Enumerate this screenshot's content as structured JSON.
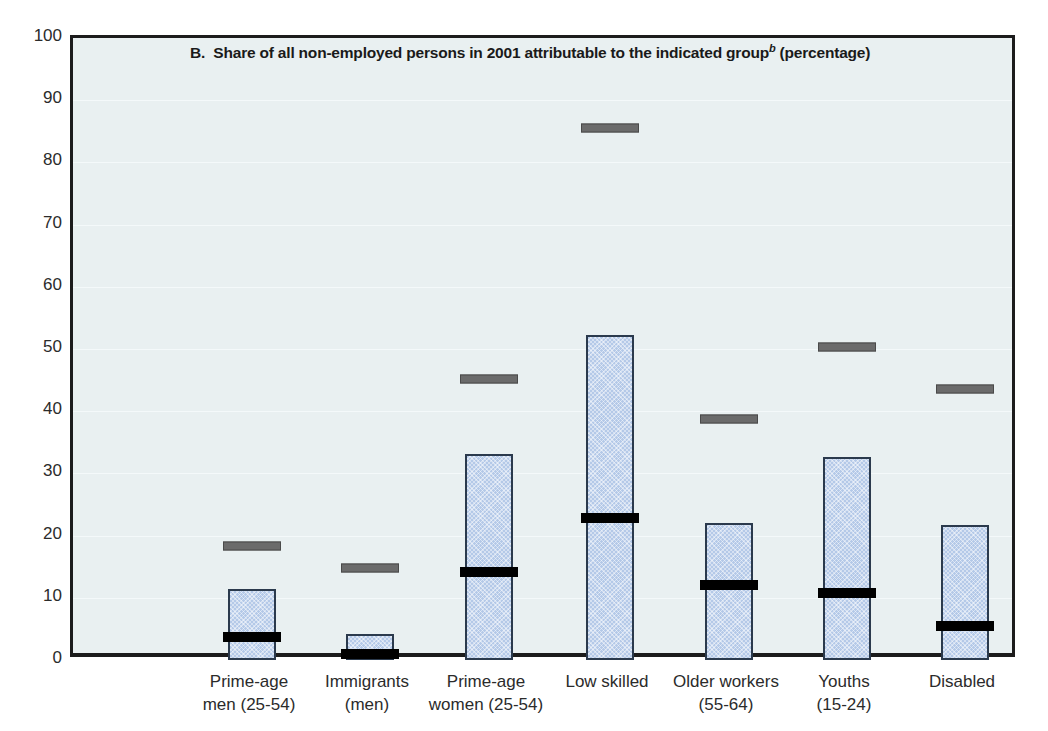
{
  "chart_data": {
    "type": "bar",
    "title_prefix": "B.",
    "title_main": "Share of all non-employed persons in 2001 attributable to the indicated group",
    "title_superscript": "b",
    "title_suffix": "(percentage)",
    "xlabel": "",
    "ylabel": "",
    "ylim": [
      0,
      100
    ],
    "ytick_values": [
      100,
      90,
      80,
      70,
      60,
      50,
      40,
      30,
      20,
      10,
      0
    ],
    "ytick_labels": [
      "100",
      "90",
      "80",
      "70",
      "60",
      "50",
      "40",
      "30",
      "20",
      "10",
      "0"
    ],
    "grid": true,
    "legend": "none",
    "categories": [
      "Prime-age men (25-54)",
      "Immigrants (men)",
      "Prime-age women (25-54)",
      "Low skilled",
      "Older workers (55-64)",
      "Youths (15-24)",
      "Disabled"
    ],
    "category_label_lines": [
      [
        "Prime-age",
        "men (25-54)"
      ],
      [
        "Immigrants",
        "(men)"
      ],
      [
        "Prime-age",
        "women (25-54)"
      ],
      [
        "Low skilled",
        ""
      ],
      [
        "Older workers",
        "(55-64)"
      ],
      [
        "Youths",
        "(15-24)"
      ],
      [
        "Disabled",
        ""
      ]
    ],
    "series": [
      {
        "name": "bar-value",
        "style": "bar",
        "color": "#b4c9e8",
        "values": [
          11.4,
          4.2,
          33.1,
          52.2,
          22.1,
          32.6,
          21.7
        ]
      },
      {
        "name": "black-marker",
        "style": "marker",
        "color": "#000000",
        "values": [
          3.7,
          0.9,
          14.1,
          22.8,
          12.0,
          10.7,
          5.4
        ]
      },
      {
        "name": "grey-marker",
        "style": "marker",
        "color": "#6b6b6b",
        "values": [
          18.3,
          14.8,
          45.2,
          85.5,
          38.7,
          50.3,
          43.6
        ]
      }
    ]
  },
  "geometry": {
    "plot_left": 70,
    "plot_top": 35,
    "plot_width": 945,
    "plot_height": 622,
    "bar_width": 48,
    "marker_width": 58,
    "bar_centers": [
      249,
      367,
      486,
      607,
      726,
      844,
      962
    ]
  }
}
